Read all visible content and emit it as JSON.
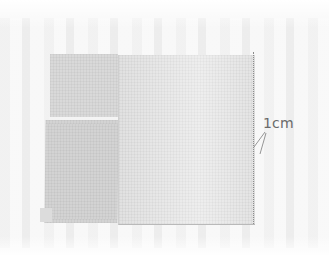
{
  "figure": {
    "type": "sewing-illustration",
    "annotation": {
      "label": "1cm",
      "meaning": "seam allowance distance from edge to stitch line"
    },
    "colors": {
      "background": "#f7f7f7",
      "left_fabric": "#d6d6d6",
      "right_fabric": "#e8e8e8",
      "stitch_line": "#8c8c8c",
      "label_text": "#6a6a6a"
    }
  }
}
